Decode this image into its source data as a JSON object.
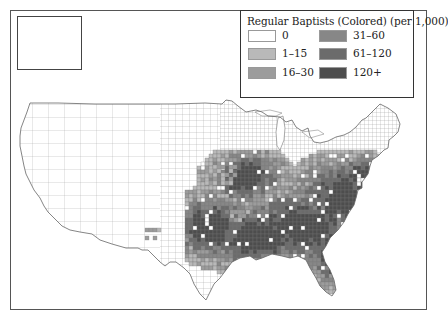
{
  "legend": {
    "title": "Regular Baptists (Colored) (per 1,000)",
    "items": [
      {
        "label": "0",
        "color": "#ffffff"
      },
      {
        "label": "1–15",
        "color": "#b9b9b9"
      },
      {
        "label": "16–30",
        "color": "#9c9c9c"
      },
      {
        "label": "31–60",
        "color": "#878787"
      },
      {
        "label": "61–120",
        "color": "#6b6b6b"
      },
      {
        "label": "120+",
        "color": "#4d4d4d"
      }
    ]
  },
  "map": {
    "subject": "United States counties choropleth",
    "inset": "Alaska",
    "county_line_color": "#8a8a8a",
    "high_concentration_region": "Southeast (Carolinas, Georgia, Alabama, Mississippi, Louisiana, East Texas, Virginia)"
  }
}
